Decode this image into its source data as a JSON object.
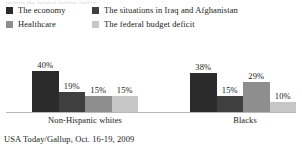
{
  "clipped_top_text": "reduce the federal budget deficit",
  "legend": {
    "rows": [
      [
        {
          "label": "The economy",
          "color": "#2b2b2b",
          "swatch_name": "legend-swatch-economy"
        },
        {
          "label": "The situations in Iraq and Afghanistan",
          "color": "#3f3f3f",
          "swatch_name": "legend-swatch-iraq-afghanistan"
        }
      ],
      [
        {
          "label": "Healthcare",
          "color": "#8e8e8e",
          "swatch_name": "legend-swatch-healthcare"
        },
        {
          "label": "The federal budget deficit",
          "color": "#c6c6c6",
          "swatch_name": "legend-swatch-budget-deficit"
        }
      ]
    ]
  },
  "source": "USA Today/Gallup, Oct. 16-19, 2009",
  "chart_data": {
    "type": "bar",
    "title": "",
    "subtitle": "",
    "xlabel": "",
    "ylabel": "",
    "ylim": [
      0,
      60
    ],
    "grid": false,
    "legend_position": "top",
    "value_suffix": "%",
    "categories": [
      "Non-Hispanic whites",
      "Blacks"
    ],
    "series": [
      {
        "name": "The economy",
        "color": "#2b2b2b",
        "values": [
          40,
          38
        ],
        "labels": [
          "40%",
          "38%"
        ]
      },
      {
        "name": "The situations in Iraq and Afghanistan",
        "color": "#3f3f3f",
        "values": [
          19,
          15
        ],
        "labels": [
          "19%",
          "15%"
        ]
      },
      {
        "name": "Healthcare",
        "color": "#8e8e8e",
        "values": [
          15,
          29
        ],
        "labels": [
          "15%",
          "29%"
        ]
      },
      {
        "name": "The federal budget deficit",
        "color": "#c6c6c6",
        "values": [
          15,
          10
        ],
        "labels": [
          "15%",
          "10%"
        ]
      }
    ]
  }
}
